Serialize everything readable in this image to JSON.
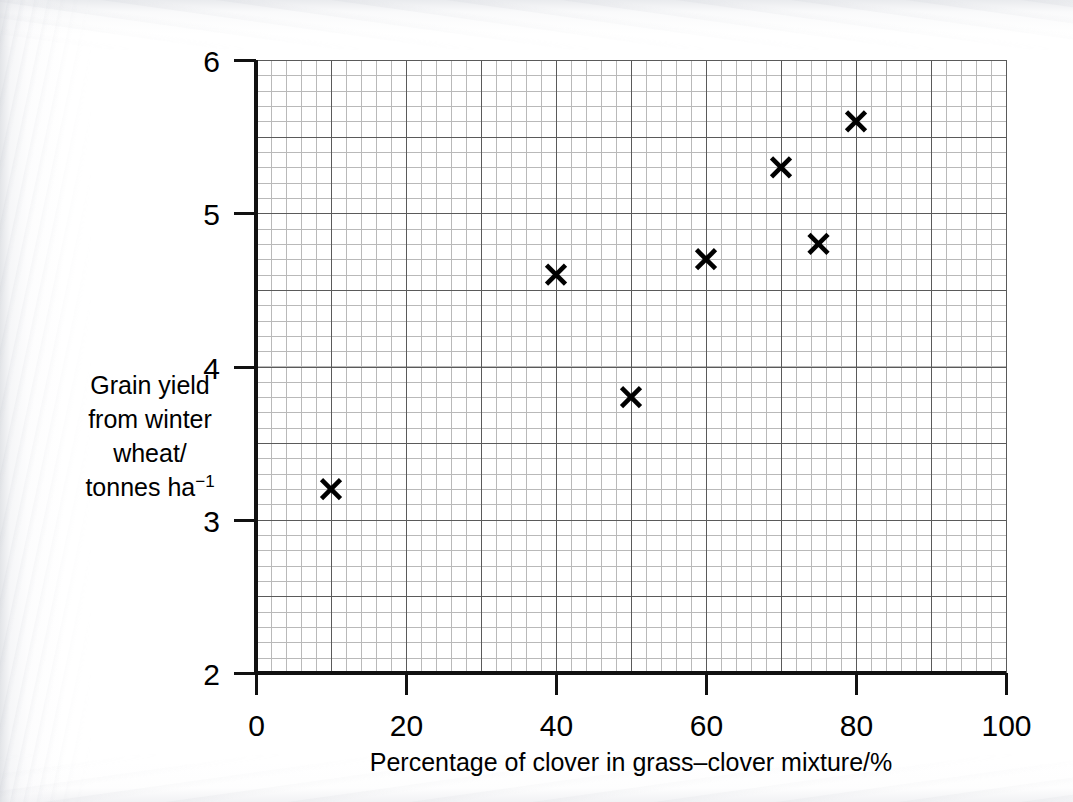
{
  "chart_data": {
    "type": "scatter",
    "title": "",
    "xlabel": "Percentage of clover in grass–clover mixture/%",
    "ylabel_lines": [
      "Grain yield",
      "from winter",
      "wheat/",
      "tonnes ha"
    ],
    "ylabel_superscript": "−1",
    "ylabel": "Grain yield from winter wheat/tonnes ha−1",
    "xlim": [
      0,
      100
    ],
    "ylim": [
      2,
      6
    ],
    "xticks": [
      0,
      20,
      40,
      60,
      80,
      100
    ],
    "xtick_labels": [
      "0",
      "20",
      "40",
      "60",
      "80",
      "100"
    ],
    "yticks": [
      2,
      3,
      4,
      5,
      6
    ],
    "ytick_labels": [
      "2",
      "3",
      "4",
      "5",
      "6"
    ],
    "x_major_gridline_step": 10,
    "x_minor_gridline_step": 2,
    "y_major_gridline_step": 0.5,
    "y_minor_gridline_step": 0.1,
    "grid": true,
    "marker": "x",
    "marker_color": "#000000",
    "points": [
      {
        "x": 10,
        "y": 3.2
      },
      {
        "x": 40,
        "y": 4.6
      },
      {
        "x": 50,
        "y": 3.8
      },
      {
        "x": 60,
        "y": 4.7
      },
      {
        "x": 70,
        "y": 5.3
      },
      {
        "x": 75,
        "y": 4.8
      },
      {
        "x": 80,
        "y": 5.6
      }
    ],
    "x_values": [
      10,
      40,
      50,
      60,
      70,
      75,
      80
    ],
    "y_values": [
      3.2,
      4.6,
      3.8,
      4.7,
      5.3,
      4.8,
      5.6
    ]
  },
  "colors": {
    "axis": "#1a1a1a",
    "major_grid": "#5a5a5a",
    "minor_grid": "#b9b9b9",
    "plot_background": "#ffffff",
    "page_background": "#ffffff"
  }
}
